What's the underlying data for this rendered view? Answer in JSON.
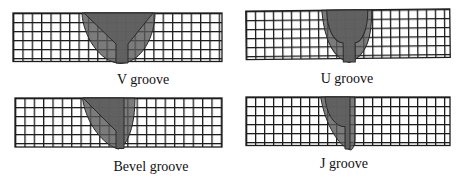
{
  "figure": {
    "panels": [
      {
        "id": "v-groove",
        "label": "V groove"
      },
      {
        "id": "u-groove",
        "label": "U groove"
      },
      {
        "id": "bevel-groove",
        "label": "Bevel groove"
      },
      {
        "id": "j-groove",
        "label": "J groove"
      }
    ]
  },
  "colors": {
    "background": "#ffffff",
    "grid_line": "#1c1c1c",
    "weld_fill": "#5a5a5a",
    "groove_fill": "#5f5f5f",
    "label_text": "#111111"
  }
}
